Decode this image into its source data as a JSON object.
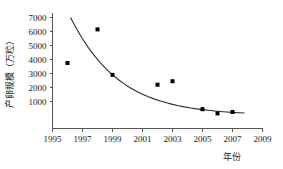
{
  "chart_data": {
    "type": "scatter",
    "title": "",
    "xlabel": "年份",
    "ylabel": "产卵规模（万粒）",
    "xlim": [
      1995,
      2009
    ],
    "ylim": [
      -1000,
      7000
    ],
    "grid": false,
    "legend": "none",
    "x_ticks": [
      "1995",
      "1997",
      "1999",
      "2001",
      "2003",
      "2005",
      "2007",
      "2009"
    ],
    "x_tick_values": [
      1995,
      1997,
      1999,
      2001,
      2003,
      2005,
      2007,
      2009
    ],
    "y_ticks": [
      "1000",
      "2000",
      "3000",
      "4000",
      "5000",
      "6000",
      "7000"
    ],
    "y_tick_values": [
      1000,
      2000,
      3000,
      4000,
      5000,
      6000,
      7000
    ],
    "x": [
      1996,
      1998,
      1999,
      2002,
      2003,
      2005,
      2006,
      2007
    ],
    "values": [
      3750,
      6150,
      2900,
      2200,
      2450,
      450,
      150,
      250
    ],
    "points": [
      {
        "x": 1996,
        "y": 3750
      },
      {
        "x": 1998,
        "y": 6150
      },
      {
        "x": 1999,
        "y": 2900
      },
      {
        "x": 2002,
        "y": 2200
      },
      {
        "x": 2003,
        "y": 2450
      },
      {
        "x": 2005,
        "y": 450
      },
      {
        "x": 2006,
        "y": 150
      },
      {
        "x": 2007,
        "y": 250
      }
    ],
    "series": [
      {
        "name": "产卵规模观测值",
        "type": "scatter",
        "marker": "square",
        "color": "#000000",
        "x": [
          1996,
          1998,
          1999,
          2002,
          2003,
          2005,
          2006,
          2007
        ],
        "values": [
          3750,
          6150,
          2900,
          2200,
          2450,
          450,
          150,
          250
        ]
      },
      {
        "name": "拟合曲线",
        "type": "line",
        "color": "#2b2b2b",
        "x": [
          1996.2,
          1996.6,
          1997.0,
          1997.4,
          1997.8,
          1998.2,
          1998.6,
          1999.0,
          1999.4,
          1999.8,
          2000.2,
          2000.6,
          2001.0,
          2001.4,
          2001.8,
          2002.2,
          2002.6,
          2003.0,
          2003.4,
          2003.8,
          2004.2,
          2004.6,
          2005.0,
          2005.4,
          2005.8,
          2006.2,
          2006.6,
          2007.0,
          2007.4,
          2007.8
        ],
        "values": [
          7000,
          6200,
          5480,
          4830,
          4260,
          3750,
          3300,
          2900,
          2550,
          2240,
          1970,
          1730,
          1520,
          1335,
          1170,
          1030,
          905,
          795,
          700,
          615,
          540,
          475,
          420,
          370,
          325,
          285,
          250,
          220,
          195,
          175
        ]
      }
    ]
  },
  "axes": {
    "y_axis_name": "产卵规模（万粒）",
    "x_axis_name": "年份"
  }
}
